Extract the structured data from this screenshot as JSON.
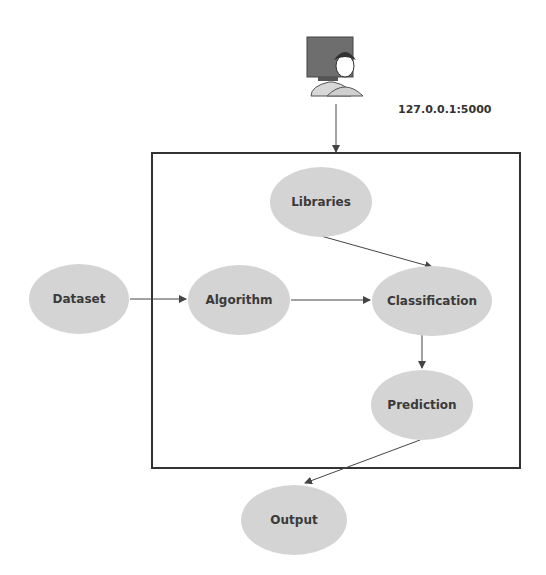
{
  "diagram": {
    "user_label": "127.0.0.1:5000",
    "nodes": {
      "dataset": "Dataset",
      "algorithm": "Algorithm",
      "libraries": "Libraries",
      "classification": "Classification",
      "prediction": "Prediction",
      "output": "Output"
    },
    "edges": [
      {
        "from": "user",
        "to": "system-box"
      },
      {
        "from": "dataset",
        "to": "algorithm"
      },
      {
        "from": "algorithm",
        "to": "classification"
      },
      {
        "from": "libraries",
        "to": "classification"
      },
      {
        "from": "classification",
        "to": "prediction"
      },
      {
        "from": "prediction",
        "to": "output"
      }
    ],
    "colors": {
      "node_fill": "#d4d4d4",
      "line": "#444444",
      "box_border": "#333333"
    }
  }
}
